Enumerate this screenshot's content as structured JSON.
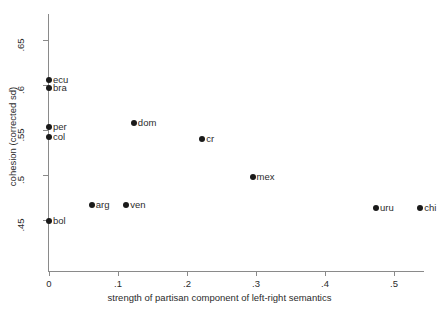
{
  "chart_data": {
    "type": "scatter",
    "title": "",
    "xlabel": "strength of partisan component of left-right semantics",
    "ylabel": "cohesion (corrected sd)",
    "xlim": [
      -0.02,
      0.545
    ],
    "ylim": [
      0.428,
      0.672
    ],
    "grid": false,
    "legend": "none",
    "xticks": [
      "0",
      ".1",
      ".2",
      ".3",
      ".4",
      ".5"
    ],
    "xtick_values": [
      0,
      0.1,
      0.2,
      0.3,
      0.4,
      0.5
    ],
    "yticks": [
      ".45",
      ".5",
      ".55",
      ".6",
      ".65"
    ],
    "ytick_values": [
      0.45,
      0.5,
      0.55,
      0.6,
      0.65
    ],
    "points": [
      {
        "label": "ecu",
        "x": 0.0,
        "y": 0.606
      },
      {
        "label": "bra",
        "x": 0.0,
        "y": 0.597
      },
      {
        "label": "per",
        "x": 0.0,
        "y": 0.553
      },
      {
        "label": "col",
        "x": 0.0,
        "y": 0.542
      },
      {
        "label": "bol",
        "x": 0.0,
        "y": 0.449
      },
      {
        "label": "arg",
        "x": 0.062,
        "y": 0.467
      },
      {
        "label": "ven",
        "x": 0.112,
        "y": 0.467
      },
      {
        "label": "dom",
        "x": 0.123,
        "y": 0.558
      },
      {
        "label": "cr",
        "x": 0.222,
        "y": 0.54
      },
      {
        "label": "mex",
        "x": 0.295,
        "y": 0.498
      },
      {
        "label": "uru",
        "x": 0.474,
        "y": 0.463
      },
      {
        "label": "chi",
        "x": 0.538,
        "y": 0.463
      }
    ],
    "marker_color": "#1a1a1a",
    "axis_color": "#8a8a8a",
    "text_color": "#2b2b2b",
    "background": "#ffffff"
  }
}
